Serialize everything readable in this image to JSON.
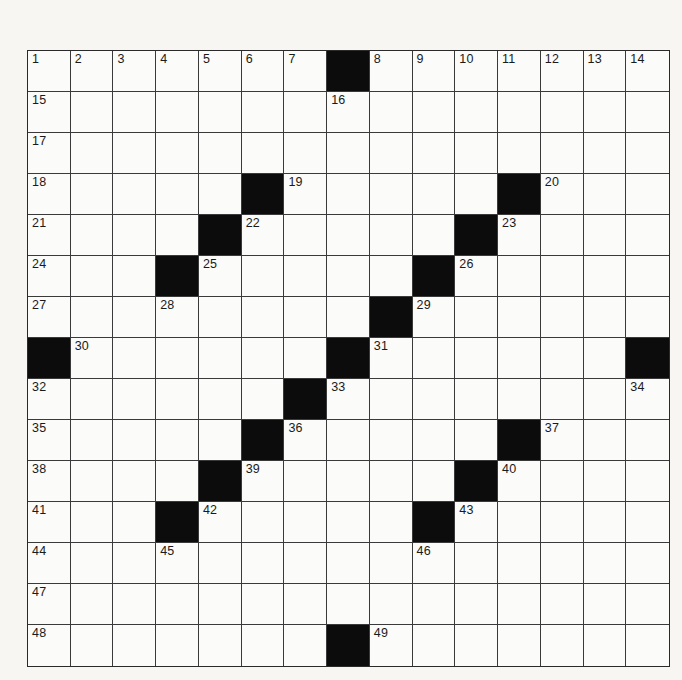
{
  "puzzle": {
    "size": {
      "rows": 15,
      "cols": 15
    },
    "colors": {
      "black_square": "#0c0c0c",
      "white_square": "#fbfbf9",
      "grid_line": "#3a3a3a",
      "page_background": "#f7f6f3"
    },
    "black_squares": [
      [
        0,
        7
      ],
      [
        3,
        5
      ],
      [
        3,
        11
      ],
      [
        4,
        4
      ],
      [
        4,
        10
      ],
      [
        5,
        3
      ],
      [
        5,
        9
      ],
      [
        6,
        8
      ],
      [
        7,
        0
      ],
      [
        7,
        7
      ],
      [
        7,
        14
      ],
      [
        8,
        6
      ],
      [
        9,
        5
      ],
      [
        9,
        11
      ],
      [
        10,
        4
      ],
      [
        10,
        10
      ],
      [
        11,
        3
      ],
      [
        11,
        9
      ],
      [
        14,
        7
      ]
    ],
    "numbers": [
      {
        "n": "1",
        "r": 0,
        "c": 0
      },
      {
        "n": "2",
        "r": 0,
        "c": 1
      },
      {
        "n": "3",
        "r": 0,
        "c": 2
      },
      {
        "n": "4",
        "r": 0,
        "c": 3
      },
      {
        "n": "5",
        "r": 0,
        "c": 4
      },
      {
        "n": "6",
        "r": 0,
        "c": 5
      },
      {
        "n": "7",
        "r": 0,
        "c": 6
      },
      {
        "n": "8",
        "r": 0,
        "c": 8
      },
      {
        "n": "9",
        "r": 0,
        "c": 9
      },
      {
        "n": "10",
        "r": 0,
        "c": 10
      },
      {
        "n": "11",
        "r": 0,
        "c": 11
      },
      {
        "n": "12",
        "r": 0,
        "c": 12
      },
      {
        "n": "13",
        "r": 0,
        "c": 13
      },
      {
        "n": "14",
        "r": 0,
        "c": 14
      },
      {
        "n": "15",
        "r": 1,
        "c": 0
      },
      {
        "n": "16",
        "r": 1,
        "c": 7
      },
      {
        "n": "17",
        "r": 2,
        "c": 0
      },
      {
        "n": "18",
        "r": 3,
        "c": 0
      },
      {
        "n": "19",
        "r": 3,
        "c": 6
      },
      {
        "n": "20",
        "r": 3,
        "c": 12
      },
      {
        "n": "21",
        "r": 4,
        "c": 0
      },
      {
        "n": "22",
        "r": 4,
        "c": 5
      },
      {
        "n": "23",
        "r": 4,
        "c": 11
      },
      {
        "n": "24",
        "r": 5,
        "c": 0
      },
      {
        "n": "25",
        "r": 5,
        "c": 4
      },
      {
        "n": "26",
        "r": 5,
        "c": 10
      },
      {
        "n": "27",
        "r": 6,
        "c": 0
      },
      {
        "n": "28",
        "r": 6,
        "c": 3
      },
      {
        "n": "29",
        "r": 6,
        "c": 9
      },
      {
        "n": "30",
        "r": 7,
        "c": 1
      },
      {
        "n": "31",
        "r": 7,
        "c": 8
      },
      {
        "n": "32",
        "r": 8,
        "c": 0
      },
      {
        "n": "33",
        "r": 8,
        "c": 7
      },
      {
        "n": "34",
        "r": 8,
        "c": 14
      },
      {
        "n": "35",
        "r": 9,
        "c": 0
      },
      {
        "n": "36",
        "r": 9,
        "c": 6
      },
      {
        "n": "37",
        "r": 9,
        "c": 12
      },
      {
        "n": "38",
        "r": 10,
        "c": 0
      },
      {
        "n": "39",
        "r": 10,
        "c": 5
      },
      {
        "n": "40",
        "r": 10,
        "c": 11
      },
      {
        "n": "41",
        "r": 11,
        "c": 0
      },
      {
        "n": "42",
        "r": 11,
        "c": 4
      },
      {
        "n": "43",
        "r": 11,
        "c": 10
      },
      {
        "n": "44",
        "r": 12,
        "c": 0
      },
      {
        "n": "45",
        "r": 12,
        "c": 3
      },
      {
        "n": "46",
        "r": 12,
        "c": 9
      },
      {
        "n": "47",
        "r": 13,
        "c": 0
      },
      {
        "n": "48",
        "r": 14,
        "c": 0
      },
      {
        "n": "49",
        "r": 14,
        "c": 8
      }
    ],
    "entries": []
  }
}
